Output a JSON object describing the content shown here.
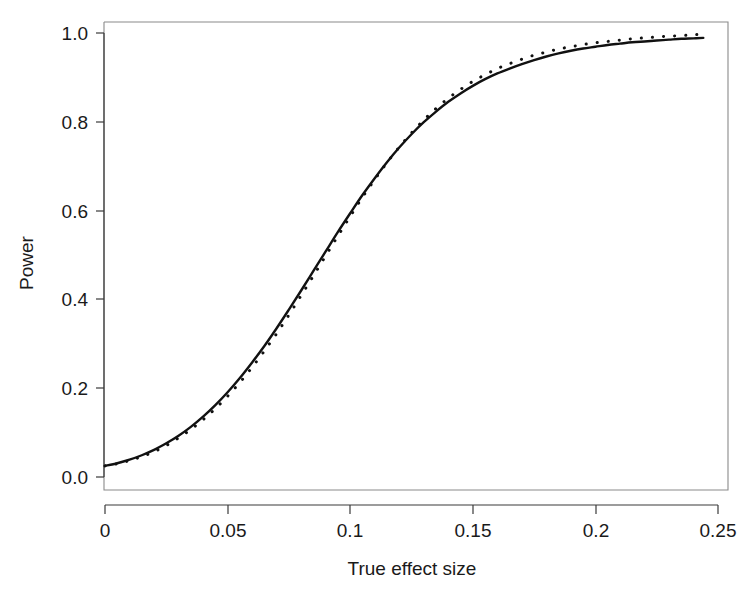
{
  "chart_data": {
    "type": "line",
    "title": "",
    "subtitle": "",
    "xlabel": "True effect size",
    "ylabel": "Power",
    "xlim": [
      0.0,
      0.25
    ],
    "ylim": [
      0.0,
      1.0
    ],
    "xticks": [
      0,
      0.05,
      0.1,
      0.15,
      0.2,
      0.25
    ],
    "xticklabels": [
      "0",
      "0.05",
      "0.1",
      "0.15",
      "0.2",
      "0.25"
    ],
    "yticks": [
      0.0,
      0.2,
      0.4,
      0.6,
      0.8,
      1.0
    ],
    "yticklabels": [
      "0.0",
      "0.2",
      "0.4",
      "0.6",
      "0.8",
      "1.0"
    ],
    "grid": false,
    "legend": null,
    "legend_position": "none",
    "box": true,
    "series": [
      {
        "name": "solid-curve",
        "style": "solid",
        "color": "#111111",
        "x": [
          0.0,
          0.005,
          0.01,
          0.015,
          0.02,
          0.025,
          0.03,
          0.035,
          0.04,
          0.045,
          0.05,
          0.055,
          0.06,
          0.065,
          0.07,
          0.075,
          0.08,
          0.085,
          0.09,
          0.095,
          0.1,
          0.105,
          0.11,
          0.115,
          0.12,
          0.125,
          0.13,
          0.135,
          0.14,
          0.145,
          0.15,
          0.155,
          0.16,
          0.165,
          0.17,
          0.175,
          0.18,
          0.185,
          0.19,
          0.195,
          0.2,
          0.205,
          0.21,
          0.215,
          0.22,
          0.225,
          0.23,
          0.235,
          0.24,
          0.244
        ],
        "y": [
          0.025,
          0.031,
          0.039,
          0.049,
          0.061,
          0.076,
          0.093,
          0.113,
          0.136,
          0.162,
          0.191,
          0.223,
          0.258,
          0.295,
          0.335,
          0.377,
          0.42,
          0.464,
          0.508,
          0.552,
          0.594,
          0.635,
          0.673,
          0.709,
          0.742,
          0.772,
          0.799,
          0.823,
          0.845,
          0.864,
          0.881,
          0.896,
          0.909,
          0.92,
          0.93,
          0.939,
          0.947,
          0.954,
          0.96,
          0.965,
          0.969,
          0.973,
          0.976,
          0.979,
          0.981,
          0.983,
          0.985,
          0.987,
          0.988,
          0.989
        ]
      },
      {
        "name": "dotted-curve",
        "style": "dotted",
        "color": "#111111",
        "x": [
          0.0,
          0.005,
          0.01,
          0.015,
          0.02,
          0.025,
          0.03,
          0.035,
          0.04,
          0.045,
          0.05,
          0.055,
          0.06,
          0.065,
          0.07,
          0.075,
          0.08,
          0.085,
          0.09,
          0.095,
          0.1,
          0.105,
          0.11,
          0.115,
          0.12,
          0.125,
          0.13,
          0.135,
          0.14,
          0.145,
          0.15,
          0.155,
          0.16,
          0.165,
          0.17,
          0.175,
          0.18,
          0.185,
          0.19,
          0.195,
          0.2,
          0.205,
          0.21,
          0.215,
          0.22,
          0.225,
          0.23,
          0.235,
          0.24,
          0.244
        ],
        "y": [
          0.025,
          0.03,
          0.037,
          0.046,
          0.057,
          0.071,
          0.088,
          0.107,
          0.129,
          0.154,
          0.182,
          0.213,
          0.247,
          0.284,
          0.323,
          0.365,
          0.409,
          0.453,
          0.498,
          0.543,
          0.587,
          0.63,
          0.67,
          0.708,
          0.743,
          0.775,
          0.804,
          0.83,
          0.853,
          0.873,
          0.891,
          0.906,
          0.92,
          0.931,
          0.941,
          0.95,
          0.957,
          0.964,
          0.969,
          0.974,
          0.978,
          0.981,
          0.984,
          0.987,
          0.989,
          0.991,
          0.993,
          0.994,
          0.996,
          0.997
        ]
      }
    ]
  },
  "axes": {
    "x_tick_labels": [
      "0",
      "0.05",
      "0.1",
      "0.15",
      "0.2",
      "0.25"
    ],
    "y_tick_labels": [
      "0.0",
      "0.2",
      "0.4",
      "0.6",
      "0.8",
      "1.0"
    ],
    "x_title": "True effect size",
    "y_title": "Power"
  },
  "colors": {
    "curve": "#111111",
    "axis": "#3a3a3a",
    "box": "#8a8a8a",
    "background": "#ffffff"
  }
}
